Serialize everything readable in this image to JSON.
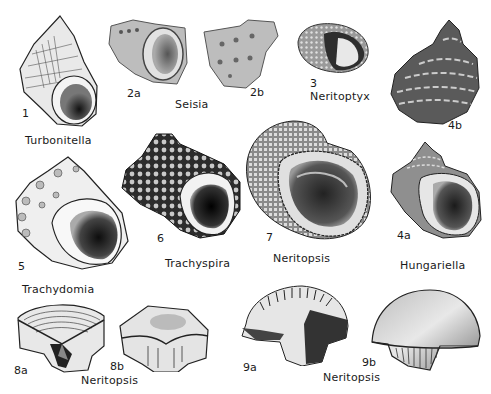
{
  "plate": {
    "figures": [
      {
        "id": "1",
        "genus": "Turbonitella"
      },
      {
        "id": "2a",
        "genus": "Seisia"
      },
      {
        "id": "2b",
        "genus": "Seisia"
      },
      {
        "id": "3",
        "genus": "Neritoptyx"
      },
      {
        "id": "4a",
        "genus": "Hungariella"
      },
      {
        "id": "4b",
        "genus": "Hungariella"
      },
      {
        "id": "5",
        "genus": "Trachydomia"
      },
      {
        "id": "6",
        "genus": "Trachyspira"
      },
      {
        "id": "7",
        "genus": "Neritopsis"
      },
      {
        "id": "8a",
        "genus": "Neritopsis"
      },
      {
        "id": "8b",
        "genus": "Neritopsis"
      },
      {
        "id": "9a",
        "genus": "Neritopsis"
      },
      {
        "id": "9b",
        "genus": "Neritopsis"
      }
    ],
    "labels": {
      "turbonitella": "Turbonitella",
      "seisia": "Seisia",
      "neritoptyx": "Neritoptyx",
      "trachydomia": "Trachydomia",
      "trachyspira": "Trachyspira",
      "neritopsis_7": "Neritopsis",
      "hungariella": "Hungariella",
      "neritopsis_8": "Neritopsis",
      "neritopsis_9": "Neritopsis"
    },
    "numbers": {
      "n1": "1",
      "n2a": "2a",
      "n2b": "2b",
      "n3": "3",
      "n4a": "4a",
      "n4b": "4b",
      "n5": "5",
      "n6": "6",
      "n7": "7",
      "n8a": "8a",
      "n8b": "8b",
      "n9a": "9a",
      "n9b": "9b"
    },
    "colors": {
      "ink": "#1a1a1a",
      "shade_dark": "#2a2a2a",
      "shade_mid": "#7a7a7a",
      "shade_light": "#c8c8c8",
      "paper": "#ffffff"
    }
  }
}
